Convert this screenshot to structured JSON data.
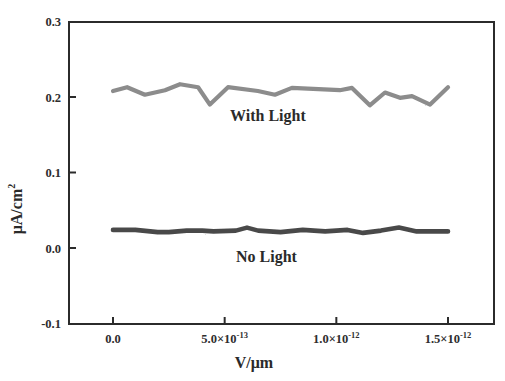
{
  "chart_data": {
    "type": "line",
    "title": "",
    "xlabel": "V/μm",
    "ylabel": "μA/cm²",
    "xlim": [
      -1.6e-13,
      1.65e-12
    ],
    "ylim": [
      -0.1,
      0.3
    ],
    "grid": false,
    "legend": "none (inline annotations)",
    "x_ticks": [
      {
        "value": 0,
        "label": "0.0",
        "mantissa": "0.0",
        "exp": ""
      },
      {
        "value": 5e-13,
        "label": "5.0×10⁻¹³",
        "mantissa": "5.0×10",
        "exp": "-13"
      },
      {
        "value": 1e-12,
        "label": "1.0×10⁻¹²",
        "mantissa": "1.0×10",
        "exp": "-12"
      },
      {
        "value": 1.5e-12,
        "label": "1.5×10⁻¹²",
        "mantissa": "1.5×10",
        "exp": "-12"
      }
    ],
    "y_ticks": [
      {
        "value": 0.3,
        "label": "0.3"
      },
      {
        "value": 0.2,
        "label": "0.2"
      },
      {
        "value": 0.1,
        "label": "0.1"
      },
      {
        "value": 0.0,
        "label": "0.0"
      },
      {
        "value": -0.1,
        "label": "-0.1"
      }
    ],
    "series": [
      {
        "name": "With Light",
        "color": "#8c8c8c",
        "x": [
          0,
          6.3e-14,
          1.43e-13,
          2.33e-13,
          3e-13,
          3.81e-13,
          4.34e-13,
          5.15e-13,
          6.49e-13,
          7.25e-13,
          8.01e-13,
          1.016e-12,
          1.07e-12,
          1.15e-12,
          1.218e-12,
          1.285e-12,
          1.339e-12,
          1.42e-12,
          1.5e-12
        ],
        "values": [
          0.208,
          0.213,
          0.203,
          0.209,
          0.217,
          0.213,
          0.19,
          0.213,
          0.208,
          0.203,
          0.212,
          0.209,
          0.212,
          0.189,
          0.206,
          0.199,
          0.201,
          0.19,
          0.213
        ]
      },
      {
        "name": "No Light",
        "color": "#4a4a4a",
        "x": [
          0,
          1e-13,
          2e-13,
          2.5e-13,
          3.3e-13,
          4e-13,
          4.5e-13,
          5.5e-13,
          6e-13,
          6.5e-13,
          7.5e-13,
          8.5e-13,
          9.5e-13,
          1.05e-12,
          1.12e-12,
          1.2e-12,
          1.28e-12,
          1.36e-12,
          1.5e-12
        ],
        "values": [
          0.024,
          0.024,
          0.021,
          0.021,
          0.023,
          0.023,
          0.022,
          0.023,
          0.027,
          0.023,
          0.021,
          0.024,
          0.022,
          0.024,
          0.02,
          0.023,
          0.027,
          0.022,
          0.022
        ]
      }
    ],
    "annotations": [
      {
        "text": "With Light",
        "x": 7.5e-13,
        "y": 0.175
      },
      {
        "text": "No Light",
        "x": 7.5e-13,
        "y": -0.013
      }
    ]
  },
  "labels": {
    "with_light": "With Light",
    "no_light": "No Light",
    "xlabel": "V/μm",
    "ylabel_main": "μA/cm",
    "ylabel_sup": "2"
  }
}
